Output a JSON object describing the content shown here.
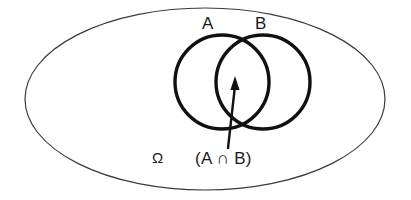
{
  "diagram": {
    "kind": "venn-diagram",
    "background_color": "#ffffff",
    "stroke_color": "#1a1a1a",
    "universe": {
      "label": "Ω",
      "shape": "ellipse",
      "stroke_color": "#3a3a3a",
      "stroke_width": 1.2,
      "fill": "none",
      "center": {
        "cx": 205,
        "cy": 99
      },
      "radii": {
        "rx": 180,
        "ry": 91
      }
    },
    "sets": [
      {
        "label": "A",
        "shape": "circle",
        "stroke_color": "#111111",
        "stroke_width": 3.4,
        "fill": "none",
        "center": {
          "cx": 222,
          "cy": 82
        },
        "radius": 47
      },
      {
        "label": "B",
        "shape": "circle",
        "stroke_color": "#111111",
        "stroke_width": 3.4,
        "fill": "none",
        "center": {
          "cx": 263,
          "cy": 82
        },
        "radius": 47
      }
    ],
    "annotation": {
      "label": "(A ∩ B)",
      "meaning": "intersection-of-a-and-b",
      "arrow": {
        "from": {
          "x": 228,
          "y": 148
        },
        "to": {
          "x": 235,
          "y": 78
        },
        "stroke_color": "#111111",
        "stroke_width": 2.4,
        "head": "filled-triangle"
      }
    }
  }
}
